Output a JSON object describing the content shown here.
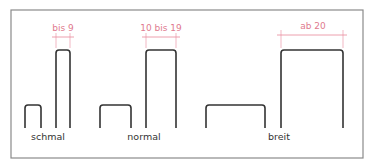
{
  "diagram": {
    "colors": {
      "frame": "#8a8a8a",
      "outline": "#333333",
      "dimension": "#e07a8e",
      "background": "#ffffff"
    },
    "groups": [
      {
        "label": "schmal",
        "dimension": "bis 9"
      },
      {
        "label": "normal",
        "dimension": "10 bis 19"
      },
      {
        "label": "breit",
        "dimension": "ab 20"
      }
    ]
  }
}
